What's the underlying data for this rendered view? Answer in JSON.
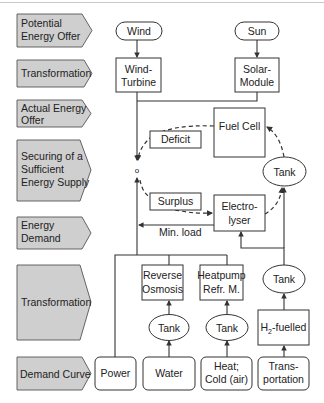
{
  "diagram": {
    "stages": [
      {
        "lines": [
          "Potential",
          "Energy Offer"
        ]
      },
      {
        "lines": [
          "Transformation"
        ]
      },
      {
        "lines": [
          "Actual Energy",
          "Offer"
        ]
      },
      {
        "lines": [
          "Securing of a",
          "Sufficient",
          "Energy Supply"
        ]
      },
      {
        "lines": [
          "Energy",
          "Demand"
        ]
      },
      {
        "lines": [
          "Transformation"
        ]
      },
      {
        "lines": [
          "Demand Curve"
        ]
      }
    ],
    "sources": {
      "wind": "Wind",
      "sun": "Sun"
    },
    "converters": {
      "wind_turbine": [
        "Wind-",
        "Turbine"
      ],
      "solar_module": [
        "Solar-",
        "Module"
      ]
    },
    "storage": {
      "fuel_cell": "Fuel Cell",
      "deficit": "Deficit",
      "surplus": "Surplus",
      "electrolyser": [
        "Electro-",
        "lyser"
      ],
      "tank_h2": "Tank",
      "min_load": "Min. load",
      "node_symbol": "o"
    },
    "demand_transformation": {
      "reverse_osmosis": [
        "Reverse",
        "Osmosis"
      ],
      "heatpump": [
        "Heatpump",
        "Refr. M."
      ],
      "tank_water": "Tank",
      "tank_heat": "Tank",
      "tank_transport": "Tank",
      "h2_fuelled": {
        "prefix": "H",
        "sub": "2",
        "suffix": "-fuelled"
      }
    },
    "demand_curve": {
      "power": "Power",
      "water": "Water",
      "heat": [
        "Heat;",
        "Cold (air)"
      ],
      "transport": [
        "Trans-",
        "portation"
      ]
    }
  }
}
